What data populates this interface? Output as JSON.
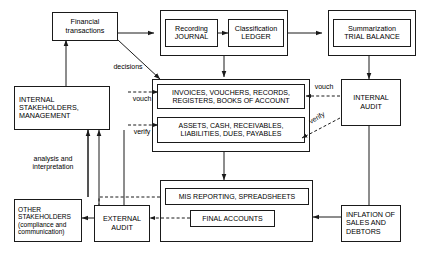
{
  "diagram": {
    "stroke_color": "#1a1a1a",
    "background": "#ffffff",
    "nodes": {
      "financial_transactions": "Financial\ntransactions",
      "recording_journal": "Recording\nJOURNAL",
      "classification_ledger": "Classification\nLEDGER",
      "summarization_trial_balance": "Summarization\nTRIAL BALANCE",
      "internal_stakeholders": "INTERNAL\nSTAKEHOLDERS,\nMANAGEMENT",
      "invoices_vouchers": "INVOICES, VOUCHERS, RECORDS,\nREGISTERS, BOOKS OF ACCOUNT",
      "assets_cash": "ASSETS, CASH, RECEIVABLES,\nLIABILITIES, DUES, PAYABLES",
      "internal_audit": "INTERNAL\nAUDIT",
      "mis_reporting": "MIS REPORTING, SPREADSHEETS",
      "final_accounts": "FINAL ACCOUNTS",
      "external_audit": "EXTERNAL\nAUDIT",
      "other_stakeholders": "OTHER\nSTAKEHOLDERS\n(compliance and\ncommunication)",
      "inflation_sales": "INFLATION OF\nSALES AND\nDEBTORS"
    },
    "edge_labels": {
      "decisions": "decisions",
      "vouch_left": "vouch",
      "verify_left": "verify",
      "vouch_right": "vouch",
      "verify_right": "verify",
      "analysis": "analysis and\ninterpretation"
    }
  }
}
